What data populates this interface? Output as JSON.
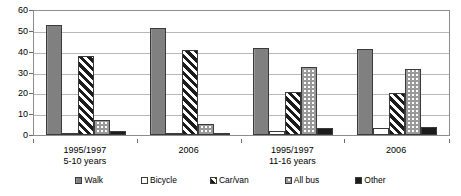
{
  "chart_data": {
    "type": "bar",
    "title": "",
    "subtitle": "",
    "xlabel": "",
    "ylabel": "",
    "ylim": [
      0,
      60
    ],
    "y_ticks": [
      0,
      10,
      20,
      30,
      40,
      50,
      60
    ],
    "grid": true,
    "legend_position": "bottom",
    "categories": [
      "1995/1997 5-10 years",
      "2006 5-10 years",
      "1995/1997 11-16 years",
      "2006 11-16 years"
    ],
    "category_labels": [
      {
        "line1": "1995/1997",
        "line2": "5-10 years"
      },
      {
        "line1": "2006",
        "line2": ""
      },
      {
        "line1": "1995/1997",
        "line2": "11-16 years"
      },
      {
        "line1": "2006",
        "line2": ""
      }
    ],
    "series": [
      {
        "name": "Walk",
        "key": "walk",
        "fill": "solid-grey",
        "values": [
          53,
          51.5,
          42,
          41.5
        ]
      },
      {
        "name": "Bicycle",
        "key": "bicycle",
        "fill": "white",
        "values": [
          0.5,
          1,
          2,
          3.5
        ]
      },
      {
        "name": "Car/van",
        "key": "carvan",
        "fill": "diagonal-hatch",
        "values": [
          38,
          41,
          20.5,
          20
        ]
      },
      {
        "name": "All bus",
        "key": "allbus",
        "fill": "checker",
        "values": [
          7,
          5.5,
          32.5,
          31.5
        ]
      },
      {
        "name": "Other",
        "key": "other",
        "fill": "solid-black",
        "values": [
          2,
          1,
          3.5,
          4
        ]
      }
    ]
  }
}
